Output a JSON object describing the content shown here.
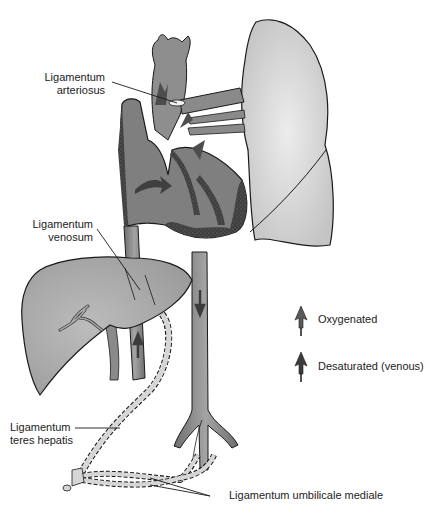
{
  "diagram": {
    "type": "anatomical-illustration",
    "colors": {
      "background": "#ffffff",
      "lung_fill": "#d9d9d9",
      "vessel_fill": "#8c8c8c",
      "heart_fill": "#7f7f7f",
      "myocardium": "#3f3f3f",
      "liver_fill": "#a9a9a9",
      "ligament_fill": "#d6d6d6",
      "outline": "#1a1a1a",
      "arrow_oxygenated": "#5a5a5a",
      "arrow_desaturated": "#3c3c3c"
    }
  },
  "labels": {
    "arteriosus": {
      "line1": "Ligamentum",
      "line2": "arteriosus"
    },
    "venosum": {
      "line1": "Ligamentum",
      "line2": "venosum"
    },
    "teres": {
      "line1": "Ligamentum",
      "line2": "teres hepatis"
    },
    "umbilicale": {
      "text": "Ligamentum umbilicale mediale"
    }
  },
  "legend": {
    "items": [
      {
        "icon": "oxygenated-arrow-icon",
        "label": "Oxygenated"
      },
      {
        "icon": "desaturated-arrow-icon",
        "label": "Desaturated (venous)"
      }
    ]
  }
}
